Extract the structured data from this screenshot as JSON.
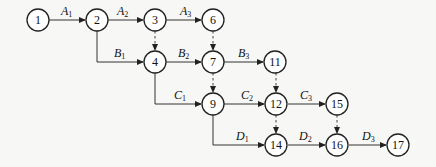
{
  "diagram": {
    "type": "activity-on-arrow network",
    "nodes": [
      {
        "id": "1",
        "x": 38,
        "y": 20
      },
      {
        "id": "2",
        "x": 97,
        "y": 20
      },
      {
        "id": "3",
        "x": 155,
        "y": 20
      },
      {
        "id": "6",
        "x": 213,
        "y": 20
      },
      {
        "id": "4",
        "x": 155,
        "y": 62
      },
      {
        "id": "7",
        "x": 213,
        "y": 62
      },
      {
        "id": "11",
        "x": 275,
        "y": 62
      },
      {
        "id": "9",
        "x": 213,
        "y": 104
      },
      {
        "id": "12",
        "x": 276,
        "y": 104
      },
      {
        "id": "15",
        "x": 337,
        "y": 104
      },
      {
        "id": "14",
        "x": 276,
        "y": 145
      },
      {
        "id": "16",
        "x": 337,
        "y": 145
      },
      {
        "id": "17",
        "x": 398,
        "y": 145
      }
    ],
    "activities": [
      {
        "from": "1",
        "to": "2",
        "label": "A",
        "sub": "1"
      },
      {
        "from": "2",
        "to": "3",
        "label": "A",
        "sub": "2"
      },
      {
        "from": "3",
        "to": "6",
        "label": "A",
        "sub": "3"
      },
      {
        "from": "2",
        "to": "4",
        "label": "B",
        "sub": "1"
      },
      {
        "from": "4",
        "to": "7",
        "label": "B",
        "sub": "2"
      },
      {
        "from": "7",
        "to": "11",
        "label": "B",
        "sub": "3"
      },
      {
        "from": "4",
        "to": "9",
        "label": "C",
        "sub": "1"
      },
      {
        "from": "9",
        "to": "12",
        "label": "C",
        "sub": "2"
      },
      {
        "from": "12",
        "to": "15",
        "label": "C",
        "sub": "3"
      },
      {
        "from": "9",
        "to": "14",
        "label": "D",
        "sub": "1"
      },
      {
        "from": "14",
        "to": "16",
        "label": "D",
        "sub": "2"
      },
      {
        "from": "16",
        "to": "17",
        "label": "D",
        "sub": "3"
      }
    ],
    "dummy_activities": [
      {
        "from": "3",
        "to": "4"
      },
      {
        "from": "6",
        "to": "7"
      },
      {
        "from": "7",
        "to": "9"
      },
      {
        "from": "11",
        "to": "12"
      },
      {
        "from": "12",
        "to": "14"
      },
      {
        "from": "15",
        "to": "16"
      }
    ]
  },
  "labels": {
    "n1": "1",
    "n2": "2",
    "n3": "3",
    "n6": "6",
    "n4": "4",
    "n7": "7",
    "n11": "11",
    "n9": "9",
    "n12": "12",
    "n15": "15",
    "n14": "14",
    "n16": "16",
    "n17": "17",
    "A": "A",
    "B": "B",
    "C": "C",
    "D": "D",
    "s1": "1",
    "s2": "2",
    "s3": "3"
  }
}
